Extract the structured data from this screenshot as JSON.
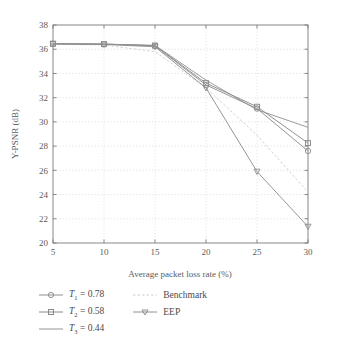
{
  "chart_data": {
    "type": "line",
    "title": "",
    "subtitle": "",
    "xlabel": "Average packet loss rate (%)",
    "ylabel": "Y-PSNR (dB)",
    "x": [
      5,
      10,
      15,
      20,
      25,
      30
    ],
    "xlim": [
      5,
      30
    ],
    "ylim": [
      20,
      38
    ],
    "xticks": [
      5,
      10,
      15,
      20,
      25,
      30
    ],
    "yticks": [
      20,
      22,
      24,
      26,
      28,
      30,
      32,
      34,
      36,
      38
    ],
    "xticklabels": [
      "5",
      "10",
      "15",
      "20",
      "25",
      "30"
    ],
    "yticklabels": [
      "20",
      "22",
      "24",
      "26",
      "28",
      "30",
      "32",
      "34",
      "36",
      "38"
    ],
    "grid": "dotted-both",
    "legend_position": "below-plot",
    "series": [
      {
        "name": "T1 = 0.78",
        "marker": "circle",
        "color": "#8f8f8f",
        "values": [
          36.45,
          36.42,
          36.28,
          33.05,
          31.1,
          27.6
        ]
      },
      {
        "name": "T2 = 0.58",
        "marker": "square",
        "color": "#8a8a8a",
        "values": [
          36.45,
          36.42,
          36.3,
          33.2,
          31.25,
          28.25
        ]
      },
      {
        "name": "T3 = 0.44",
        "marker": "none",
        "color": "#959595",
        "values": [
          36.45,
          36.42,
          36.32,
          33.45,
          31.0,
          29.55
        ]
      },
      {
        "name": "Benchmark",
        "marker": "none",
        "color": "#cdcdcd",
        "values": [
          36.4,
          36.35,
          35.8,
          32.8,
          28.9,
          24.2
        ]
      },
      {
        "name": "EEP",
        "marker": "triangle-down",
        "color": "#909090",
        "values": [
          36.45,
          36.4,
          36.2,
          32.8,
          25.9,
          21.35
        ]
      }
    ]
  },
  "legend": {
    "columns": [
      {
        "entries": [
          {
            "base": "T",
            "sub": "1",
            "rest": " = 0.78",
            "key": "circle"
          },
          {
            "base": "T",
            "sub": "2",
            "rest": " = 0.58",
            "key": "square"
          },
          {
            "base": "T",
            "sub": "3",
            "rest": " = 0.44",
            "key": "plain"
          }
        ]
      },
      {
        "entries": [
          {
            "base": "",
            "sub": "",
            "rest": "Benchmark",
            "key": "dotted"
          },
          {
            "base": "",
            "sub": "",
            "rest": "EEP",
            "key": "triangle"
          }
        ]
      }
    ],
    "labels": {
      "t1": "T",
      "t1_sub": "1",
      "t1_rest": " = 0.78",
      "t2": "T",
      "t2_sub": "2",
      "t2_rest": " = 0.58",
      "t3": "T",
      "t3_sub": "3",
      "t3_rest": " = 0.44",
      "benchmark": "Benchmark",
      "eep": "EEP"
    }
  },
  "colors": {
    "axis": "#7a7a7a",
    "grid": "#d0d0d0",
    "text": "#4f4f4f",
    "benchmark": "#cdcdcd",
    "series_gray": "#8f8f8f"
  }
}
